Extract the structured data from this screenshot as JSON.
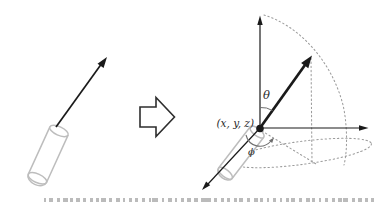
{
  "figure": {
    "labels": {
      "theta": "θ",
      "phi": "ϕ",
      "origin_point": "(x, y, z)"
    },
    "colors": {
      "ink": "#1a1a1a",
      "cylinder": "#bdbdbd",
      "dotted": "#9c9c9c",
      "angle": "#6e6e6e",
      "caption": "#8f8f8f"
    }
  }
}
